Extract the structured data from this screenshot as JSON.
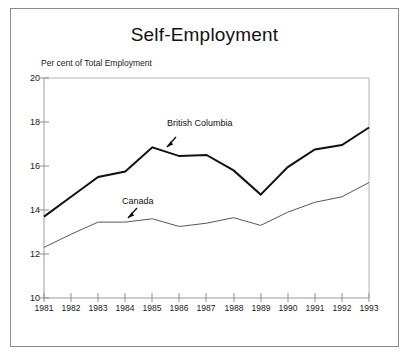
{
  "figure": {
    "title": "Self-Employment",
    "unit_label": "Per cent of Total Employment",
    "frame_color": "#8a8a8a",
    "background_color": "#ffffff"
  },
  "axes": {
    "y_ticks": [
      "20",
      "18",
      "16",
      "14",
      "12",
      "10"
    ],
    "x_ticks": [
      "1981",
      "1982",
      "1983",
      "1984",
      "1985",
      "1986",
      "1987",
      "1988",
      "1989",
      "1990",
      "1991",
      "1992",
      "1993"
    ]
  },
  "annotations": {
    "british_columbia": "British Columbia",
    "canada": "Canada"
  },
  "chart_data": {
    "type": "line",
    "title": "Self-Employment",
    "subtitle": "",
    "xlabel": "",
    "ylabel": "Per cent of Total Employment",
    "xlim": [
      1981,
      1993
    ],
    "ylim": [
      10,
      20
    ],
    "ytick_interval": 2,
    "grid": false,
    "legend": "inline annotations with arrows",
    "x": [
      1981,
      1982,
      1983,
      1984,
      1985,
      1986,
      1987,
      1988,
      1989,
      1990,
      1991,
      1992,
      1993
    ],
    "categories": [
      "1981",
      "1982",
      "1983",
      "1984",
      "1985",
      "1986",
      "1987",
      "1988",
      "1989",
      "1990",
      "1991",
      "1992",
      "1993"
    ],
    "series": [
      {
        "name": "British Columbia",
        "line_color": "#111111",
        "line_width": 2.0,
        "values": [
          13.7,
          14.6,
          15.5,
          15.75,
          16.85,
          16.45,
          16.5,
          15.8,
          14.7,
          15.95,
          16.75,
          16.95,
          17.75
        ]
      },
      {
        "name": "Canada",
        "line_color": "#444444",
        "line_width": 0.9,
        "values": [
          12.3,
          12.9,
          13.45,
          13.45,
          13.6,
          13.25,
          13.4,
          13.65,
          13.3,
          13.9,
          14.35,
          14.6,
          15.25
        ]
      }
    ]
  }
}
